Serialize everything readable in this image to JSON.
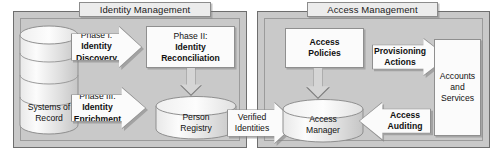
{
  "diagram": {
    "colors": {
      "panel_fill": "#c9c9c9",
      "panel_border": "#6e6e6e",
      "shape_fill": "#fbfbfb",
      "shape_border": "#8f8f8f",
      "arrow_down_fill": "#d5d5d5",
      "title_tab_fill": "#ececec",
      "text": "#111111",
      "background": "#ffffff"
    }
  },
  "groups": [
    {
      "id": "identity-management",
      "label": "Identity Management"
    },
    {
      "id": "access-management",
      "label": "Access Management"
    }
  ],
  "nodes": {
    "systems_of_record": {
      "line1": "Systems of",
      "line2": "Record",
      "shape": "stacked-cylinder"
    },
    "phase1": {
      "line1": "Phase I:",
      "line2": "Identity",
      "line3": "Discovery",
      "shape": "right-arrow"
    },
    "phase2": {
      "line1": "Phase II:",
      "line2": "Identity",
      "line3": "Reconciliation",
      "shape": "rectangle"
    },
    "phase3": {
      "line1": "Phase III:",
      "line2": "Identity",
      "line3": "Enrichment",
      "shape": "right-arrow"
    },
    "person_registry": {
      "line1": "Person",
      "line2": "Registry",
      "shape": "cylinder"
    },
    "verified_identities": {
      "line1": "Verified",
      "line2": "Identities",
      "shape": "right-arrow"
    },
    "access_policies": {
      "line1": "Access",
      "line2": "Policies",
      "shape": "rectangle"
    },
    "provisioning_actions": {
      "line1": "Provisioning",
      "line2": "Actions",
      "shape": "right-arrow"
    },
    "accounts_and_services": {
      "line1": "Accounts",
      "line2": "and",
      "line3": "Services",
      "shape": "rectangle"
    },
    "access_manager": {
      "line1": "Access",
      "line2": "Manager",
      "shape": "cylinder"
    },
    "access_auditing": {
      "line1": "Access",
      "line2": "Auditing",
      "shape": "left-arrow"
    }
  },
  "connectors": [
    {
      "id": "phase2-to-registry",
      "shape": "down-arrow"
    },
    {
      "id": "policies-to-manager",
      "shape": "down-arrow"
    }
  ]
}
